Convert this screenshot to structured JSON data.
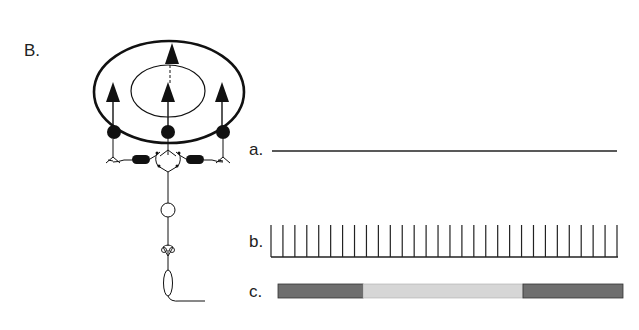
{
  "figure": {
    "panel_label": "B.",
    "rows": [
      {
        "label": "a.",
        "type": "flat-line"
      },
      {
        "label": "b.",
        "type": "spike-train",
        "spike_count": 30
      },
      {
        "label": "c.",
        "type": "segmented-bar",
        "segments": [
          {
            "shade": "dark",
            "color": "#6e6e6e"
          },
          {
            "shade": "light",
            "color": "#d6d6d6"
          },
          {
            "shade": "dark",
            "color": "#6e6e6e"
          }
        ]
      }
    ],
    "neural_circuit": {
      "outer_ellipse": "receptive-field-surround",
      "inner_ellipse": "receptive-field-center",
      "photoreceptors": 3,
      "horizontal_cells": 2
    }
  }
}
